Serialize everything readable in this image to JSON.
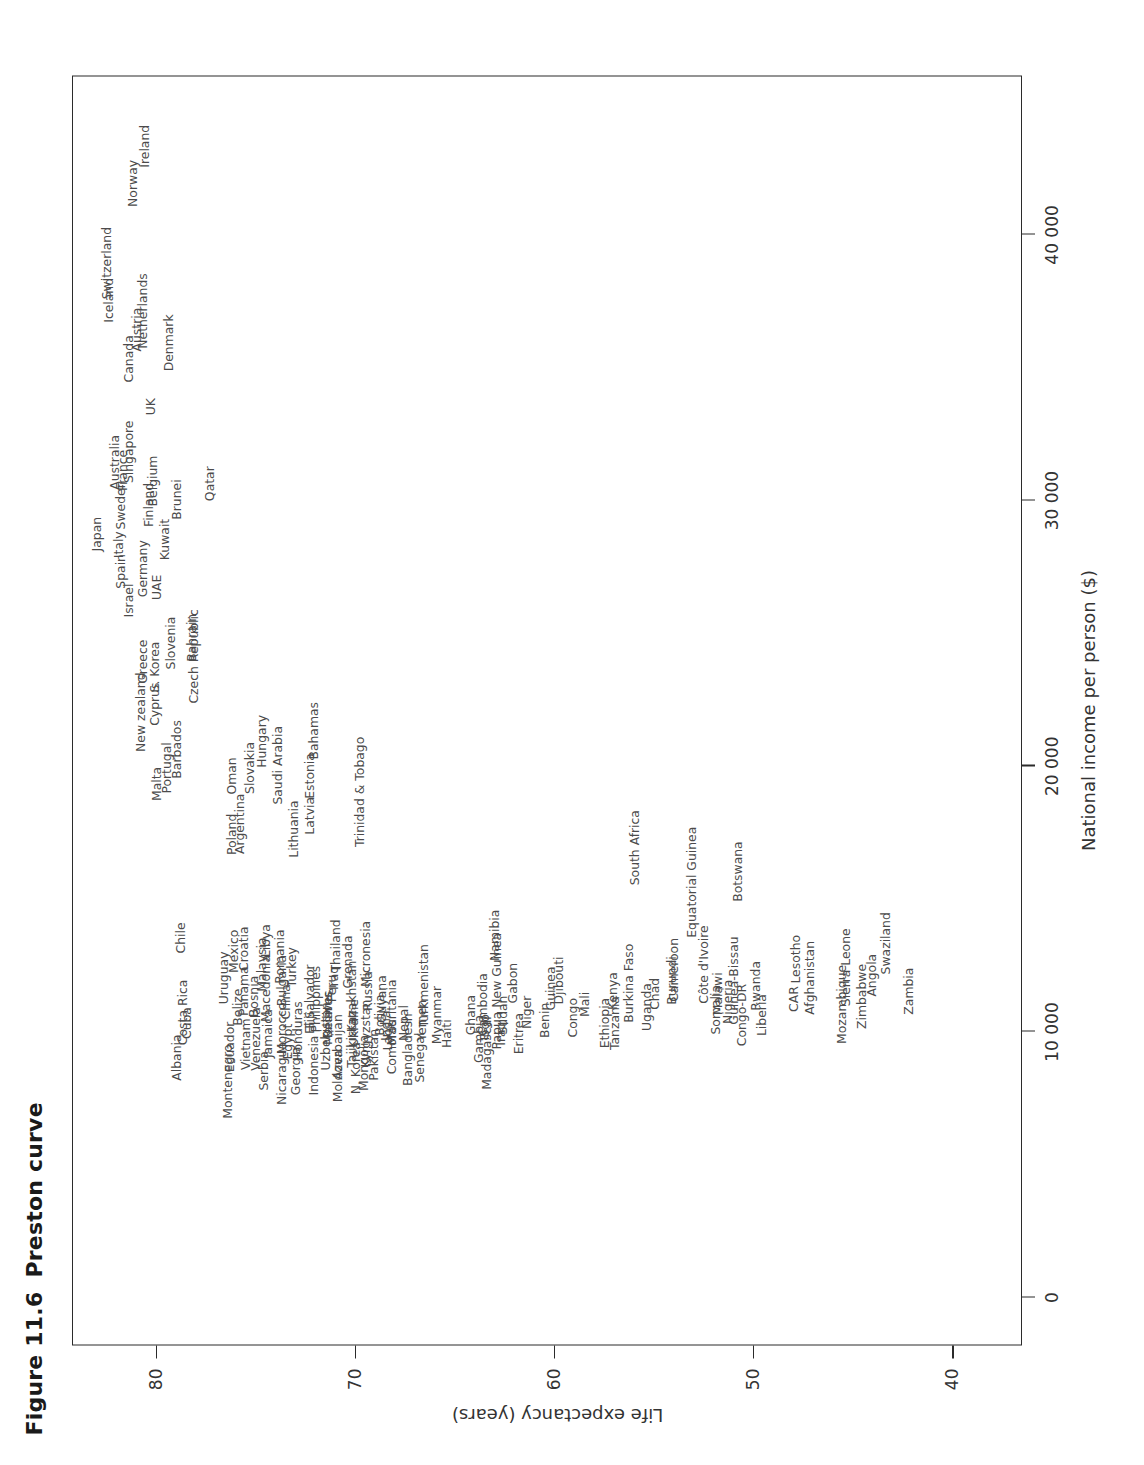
{
  "figure": {
    "number": "Figure 11.6",
    "title": "Preston curve"
  },
  "axes": {
    "x": {
      "label": "National income per person ($)",
      "ticks": [
        "0",
        "10 000",
        "20 000",
        "30 000",
        "40 000"
      ],
      "tick_values": [
        0,
        10000,
        20000,
        30000,
        40000
      ],
      "min": -1800,
      "max": 46000
    },
    "y": {
      "label": "Life expectancy (years)",
      "ticks": [
        "80",
        "70",
        "60",
        "50",
        "40"
      ],
      "tick_values": [
        80,
        70,
        60,
        50,
        40
      ],
      "min": 36.5,
      "max": 84.2
    }
  },
  "chart_data": {
    "type": "scatter",
    "title": "Preston curve",
    "xlabel": "National income per person ($)",
    "ylabel": "Life expectancy (years)",
    "xlim": [
      -1800,
      46000
    ],
    "ylim": [
      36.5,
      84.2
    ],
    "grid": false,
    "legend": "none",
    "marker": "country-name-label",
    "points": [
      {
        "label": "Japan",
        "x": 28700,
        "y": 83.0
      },
      {
        "label": "Australia",
        "x": 31400,
        "y": 82.1
      },
      {
        "label": "Switzerland",
        "x": 38900,
        "y": 82.5
      },
      {
        "label": "Iceland",
        "x": 37500,
        "y": 82.4
      },
      {
        "label": "Italy",
        "x": 28300,
        "y": 81.9
      },
      {
        "label": "Spain",
        "x": 27300,
        "y": 81.8
      },
      {
        "label": "Sweden",
        "x": 29800,
        "y": 81.8
      },
      {
        "label": "France",
        "x": 31100,
        "y": 81.7
      },
      {
        "label": "Singapore",
        "x": 31800,
        "y": 81.4
      },
      {
        "label": "Canada",
        "x": 35300,
        "y": 81.4
      },
      {
        "label": "Israel",
        "x": 26200,
        "y": 81.4
      },
      {
        "label": "Austria",
        "x": 36400,
        "y": 81.0
      },
      {
        "label": "Netherlands",
        "x": 37100,
        "y": 80.7
      },
      {
        "label": "Germany",
        "x": 27400,
        "y": 80.7
      },
      {
        "label": "Norway",
        "x": 41900,
        "y": 81.2
      },
      {
        "label": "Finland",
        "x": 29800,
        "y": 80.4
      },
      {
        "label": "Ireland",
        "x": 43300,
        "y": 80.6
      },
      {
        "label": "UK",
        "x": 33500,
        "y": 80.3
      },
      {
        "label": "Belgium",
        "x": 30700,
        "y": 80.2
      },
      {
        "label": "Denmark",
        "x": 35900,
        "y": 79.4
      },
      {
        "label": "UAE",
        "x": 26700,
        "y": 80.0
      },
      {
        "label": "Kuwait",
        "x": 28500,
        "y": 79.6
      },
      {
        "label": "Brunei",
        "x": 30000,
        "y": 79.0
      },
      {
        "label": "New zealand",
        "x": 22000,
        "y": 80.8
      },
      {
        "label": "Greece",
        "x": 23900,
        "y": 80.7
      },
      {
        "label": "Cyprus",
        "x": 22300,
        "y": 80.1
      },
      {
        "label": "S. Korea",
        "x": 23700,
        "y": 80.1
      },
      {
        "label": "Slovenia",
        "x": 24600,
        "y": 79.3
      },
      {
        "label": "Czech Republic",
        "x": 24100,
        "y": 78.1
      },
      {
        "label": "Bahrain",
        "x": 24800,
        "y": 78.2
      },
      {
        "label": "Qatar",
        "x": 30600,
        "y": 77.3
      },
      {
        "label": "Malta",
        "x": 19300,
        "y": 80.0
      },
      {
        "label": "Portugal",
        "x": 19900,
        "y": 79.5
      },
      {
        "label": "Barbados",
        "x": 20600,
        "y": 79.0
      },
      {
        "label": "Poland",
        "x": 17400,
        "y": 76.2
      },
      {
        "label": "Oman",
        "x": 19600,
        "y": 76.2
      },
      {
        "label": "Argentina",
        "x": 17800,
        "y": 75.8
      },
      {
        "label": "Slovakia",
        "x": 19900,
        "y": 75.3
      },
      {
        "label": "Hungary",
        "x": 20900,
        "y": 74.7
      },
      {
        "label": "Lithuania",
        "x": 17600,
        "y": 73.1
      },
      {
        "label": "Latvia",
        "x": 18100,
        "y": 72.3
      },
      {
        "label": "Saudi Arabia",
        "x": 20000,
        "y": 73.9
      },
      {
        "label": "Estonia",
        "x": 19600,
        "y": 72.3
      },
      {
        "label": "Bahamas",
        "x": 21300,
        "y": 72.1
      },
      {
        "label": "Trinidad & Tobago",
        "x": 19000,
        "y": 69.8
      },
      {
        "label": "Chile",
        "x": 13500,
        "y": 78.8
      },
      {
        "label": "Costa Rica",
        "x": 10700,
        "y": 78.7
      },
      {
        "label": "Cuba",
        "x": 10300,
        "y": 78.5
      },
      {
        "label": "Uruguay",
        "x": 12000,
        "y": 76.6
      },
      {
        "label": "Mexico",
        "x": 13000,
        "y": 76.1
      },
      {
        "label": "Belize",
        "x": 10900,
        "y": 75.9
      },
      {
        "label": "Panama",
        "x": 11500,
        "y": 75.6
      },
      {
        "label": "Croatia",
        "x": 13100,
        "y": 75.6
      },
      {
        "label": "Bosnia",
        "x": 11300,
        "y": 75.1
      },
      {
        "label": "Macedonia",
        "x": 11600,
        "y": 74.5
      },
      {
        "label": "Malaysia",
        "x": 12500,
        "y": 74.7
      },
      {
        "label": "Libya",
        "x": 13400,
        "y": 74.5
      },
      {
        "label": "Bulgaria",
        "x": 11900,
        "y": 73.7
      },
      {
        "label": "China",
        "x": 11100,
        "y": 73.5
      },
      {
        "label": "Romania",
        "x": 12800,
        "y": 73.8
      },
      {
        "label": "Turkey",
        "x": 12400,
        "y": 73.2
      },
      {
        "label": "El Salvador",
        "x": 11200,
        "y": 72.3
      },
      {
        "label": "Philippines",
        "x": 11200,
        "y": 72.0
      },
      {
        "label": "Iraq",
        "x": 12000,
        "y": 71.1
      },
      {
        "label": "Thailand",
        "x": 13200,
        "y": 71.0
      },
      {
        "label": "Grenada",
        "x": 12600,
        "y": 70.4
      },
      {
        "label": "Peru",
        "x": 11600,
        "y": 71.2
      },
      {
        "label": "Micronesia",
        "x": 12900,
        "y": 69.5
      },
      {
        "label": "Albania",
        "x": 9000,
        "y": 79.0
      },
      {
        "label": "Ecuador",
        "x": 9400,
        "y": 76.3
      },
      {
        "label": "Vietnam",
        "x": 9500,
        "y": 75.5
      },
      {
        "label": "Venezuela",
        "x": 9700,
        "y": 75.0
      },
      {
        "label": "Jamaica",
        "x": 9900,
        "y": 74.4
      },
      {
        "label": "Morocco",
        "x": 10100,
        "y": 73.7
      },
      {
        "label": "Egypt",
        "x": 9600,
        "y": 73.4
      },
      {
        "label": "Honduras",
        "x": 10000,
        "y": 72.9
      },
      {
        "label": "Montenegro",
        "x": 8100,
        "y": 76.4
      },
      {
        "label": "Serbia",
        "x": 8500,
        "y": 74.6
      },
      {
        "label": "Nicaragua",
        "x": 8400,
        "y": 73.7
      },
      {
        "label": "Georgia",
        "x": 8500,
        "y": 73.0
      },
      {
        "label": "Indonesia",
        "x": 8700,
        "y": 72.1
      },
      {
        "label": "Fiji",
        "x": 10400,
        "y": 72.3
      },
      {
        "label": "Belarus",
        "x": 10600,
        "y": 71.4
      },
      {
        "label": "Uzbekistan",
        "x": 9800,
        "y": 71.5
      },
      {
        "label": "Moldova",
        "x": 8300,
        "y": 70.9
      },
      {
        "label": "Azerbaijan",
        "x": 9400,
        "y": 70.9
      },
      {
        "label": "N. Korea",
        "x": 8600,
        "y": 70.0
      },
      {
        "label": "Tajikistan",
        "x": 9700,
        "y": 70.2
      },
      {
        "label": "Mongolia",
        "x": 8800,
        "y": 69.6
      },
      {
        "label": "Kyrgyzstan",
        "x": 9900,
        "y": 69.5
      },
      {
        "label": "Pakistan",
        "x": 9100,
        "y": 69.1
      },
      {
        "label": "Maldives",
        "x": 10500,
        "y": 71.4
      },
      {
        "label": "Ukraine",
        "x": 10300,
        "y": 70.1
      },
      {
        "label": "Kazakhstan",
        "x": 11300,
        "y": 70.2
      },
      {
        "label": "Russia",
        "x": 11500,
        "y": 69.4
      },
      {
        "label": "India",
        "x": 10200,
        "y": 68.5
      },
      {
        "label": "Bolivia",
        "x": 10600,
        "y": 68.8
      },
      {
        "label": "Guyana",
        "x": 11200,
        "y": 68.7
      },
      {
        "label": "Mauritania",
        "x": 10700,
        "y": 68.2
      },
      {
        "label": "Laos",
        "x": 9800,
        "y": 68.4
      },
      {
        "label": "Comoros",
        "x": 9400,
        "y": 68.2
      },
      {
        "label": "Nepal",
        "x": 10300,
        "y": 67.6
      },
      {
        "label": "Bangladesh",
        "x": 9300,
        "y": 67.4
      },
      {
        "label": "Senegal",
        "x": 9000,
        "y": 66.8
      },
      {
        "label": "Yemen",
        "x": 10400,
        "y": 66.7
      },
      {
        "label": "Turkmenistan",
        "x": 11700,
        "y": 66.6
      },
      {
        "label": "Myanmar",
        "x": 10600,
        "y": 65.9
      },
      {
        "label": "Haiti",
        "x": 9900,
        "y": 65.4
      },
      {
        "label": "Ghana",
        "x": 10600,
        "y": 64.2
      },
      {
        "label": "Togo",
        "x": 10100,
        "y": 63.5
      },
      {
        "label": "Cambodia",
        "x": 11000,
        "y": 63.6
      },
      {
        "label": "Gambia",
        "x": 9700,
        "y": 63.8
      },
      {
        "label": "Madagascar",
        "x": 9200,
        "y": 63.4
      },
      {
        "label": "Sudan",
        "x": 10600,
        "y": 62.6
      },
      {
        "label": "Iraq2",
        "x": 9900,
        "y": 62.7
      },
      {
        "label": "Papua New Guinea",
        "x": 11500,
        "y": 62.9
      },
      {
        "label": "Gabon",
        "x": 11800,
        "y": 62.1
      },
      {
        "label": "Eritrea",
        "x": 9900,
        "y": 61.8
      },
      {
        "label": "Niger",
        "x": 10700,
        "y": 61.4
      },
      {
        "label": "Benin",
        "x": 10400,
        "y": 60.5
      },
      {
        "label": "Guinea",
        "x": 11600,
        "y": 60.2
      },
      {
        "label": "Djibouti",
        "x": 11900,
        "y": 59.8
      },
      {
        "label": "Congo",
        "x": 10500,
        "y": 59.1
      },
      {
        "label": "Mali",
        "x": 11000,
        "y": 58.5
      },
      {
        "label": "Namibia",
        "x": 13600,
        "y": 63.0
      },
      {
        "label": "South Africa",
        "x": 16900,
        "y": 56.0
      },
      {
        "label": "Equatorial Guinea",
        "x": 15600,
        "y": 53.1
      },
      {
        "label": "Botswana",
        "x": 16000,
        "y": 50.8
      },
      {
        "label": "Ethiopia",
        "x": 10300,
        "y": 57.5
      },
      {
        "label": "Tanzania",
        "x": 10300,
        "y": 57.0
      },
      {
        "label": "Kenya",
        "x": 11500,
        "y": 57.1
      },
      {
        "label": "Burkina Faso",
        "x": 11800,
        "y": 56.3
      },
      {
        "label": "Uganda",
        "x": 10900,
        "y": 55.4
      },
      {
        "label": "Chad",
        "x": 11400,
        "y": 55.0
      },
      {
        "label": "Cameroon",
        "x": 12300,
        "y": 54.0
      },
      {
        "label": "Burundi",
        "x": 11900,
        "y": 54.1
      },
      {
        "label": "Côte d'Ivoire",
        "x": 12500,
        "y": 52.5
      },
      {
        "label": "Somalia",
        "x": 10800,
        "y": 51.9
      },
      {
        "label": "Malawi",
        "x": 11400,
        "y": 51.8
      },
      {
        "label": "Nigeria",
        "x": 11100,
        "y": 51.3
      },
      {
        "label": "Guinea-Bissau",
        "x": 11900,
        "y": 51.0
      },
      {
        "label": "Congo-DR",
        "x": 10600,
        "y": 50.6
      },
      {
        "label": "Rwanda",
        "x": 11700,
        "y": 49.9
      },
      {
        "label": "Liberia",
        "x": 10600,
        "y": 49.6
      },
      {
        "label": "CAR",
        "x": 11200,
        "y": 48.0
      },
      {
        "label": "Afghanistan",
        "x": 12000,
        "y": 47.2
      },
      {
        "label": "Lesotho",
        "x": 12700,
        "y": 47.9
      },
      {
        "label": "Mozambique",
        "x": 11000,
        "y": 45.6
      },
      {
        "label": "Sierra Leone",
        "x": 12400,
        "y": 45.4
      },
      {
        "label": "Zimbabwe",
        "x": 11300,
        "y": 44.6
      },
      {
        "label": "Angola",
        "x": 12100,
        "y": 44.1
      },
      {
        "label": "Swaziland",
        "x": 13300,
        "y": 43.4
      },
      {
        "label": "Zambia",
        "x": 11500,
        "y": 42.2
      }
    ]
  }
}
